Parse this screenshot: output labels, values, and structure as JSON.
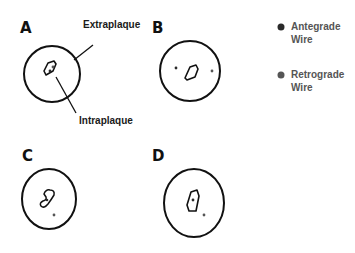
{
  "panels": [
    {
      "label": "A"
    },
    {
      "label": "B"
    },
    {
      "label": "C"
    },
    {
      "label": "D"
    }
  ],
  "annotations": {
    "extraplaque": "Extraplaque",
    "intraplaque": "Intraplaque"
  },
  "legend": {
    "items": [
      {
        "line1": "Antegrade",
        "line2": "Wire",
        "color": "#2a2a2a"
      },
      {
        "line1": "Retrograde",
        "line2": "Wire",
        "color": "#555555"
      }
    ]
  },
  "colors": {
    "stroke": "#111111",
    "antegrade": "#2a2a2a",
    "retrograde": "#555555"
  }
}
